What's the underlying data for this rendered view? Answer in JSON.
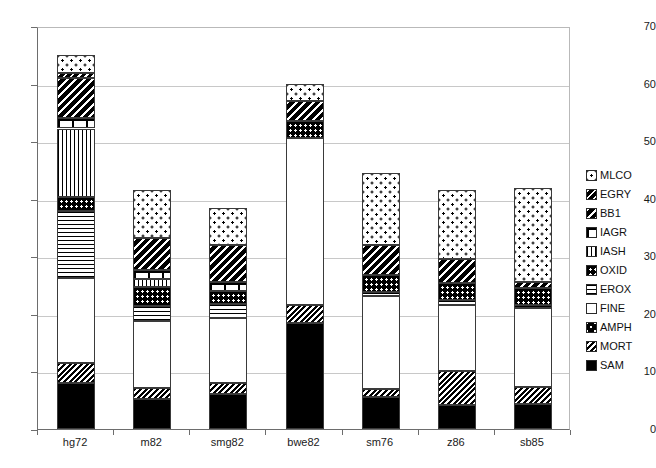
{
  "chart_data": {
    "type": "bar",
    "subtype": "stacked-bar",
    "title": "",
    "xlabel": "",
    "ylabel": "",
    "ylim": [
      0,
      70
    ],
    "yticks": [
      0,
      10,
      20,
      30,
      40,
      50,
      60,
      70
    ],
    "grid": true,
    "legend_position": "right",
    "categories": [
      "hg72",
      "m82",
      "smg82",
      "bwe82",
      "sm76",
      "z86",
      "sb85"
    ],
    "totals": [
      65.0,
      41.6,
      38.4,
      60.0,
      44.5,
      41.6,
      41.8
    ],
    "stack_order_bottom_to_top": [
      "SAM",
      "MORT",
      "AMPH",
      "FINE",
      "EROX",
      "OXID",
      "IASH",
      "IAGR",
      "BB1",
      "EGRY",
      "MLCO"
    ],
    "series": [
      {
        "name": "SAM",
        "values": [
          8.0,
          5.2,
          6.0,
          18.5,
          5.6,
          4.2,
          4.3
        ]
      },
      {
        "name": "MORT",
        "values": [
          3.5,
          2.0,
          2.0,
          3.0,
          1.3,
          5.9,
          3.0
        ]
      },
      {
        "name": "AMPH",
        "values": [
          0.0,
          0.0,
          0.0,
          0.0,
          0.0,
          0.0,
          0.0
        ]
      },
      {
        "name": "FINE",
        "values": [
          14.8,
          11.6,
          11.2,
          29.0,
          16.2,
          11.5,
          13.7
        ]
      },
      {
        "name": "EROX",
        "values": [
          11.5,
          2.6,
          2.5,
          0.0,
          0.7,
          0.8,
          0.5
        ]
      },
      {
        "name": "OXID",
        "values": [
          2.5,
          3.3,
          2.3,
          3.0,
          3.0,
          3.0,
          3.0
        ]
      },
      {
        "name": "IASH",
        "values": [
          11.9,
          1.4,
          0.0,
          0.0,
          0.0,
          0.0,
          0.0
        ]
      },
      {
        "name": "IAGR",
        "values": [
          1.8,
          1.5,
          1.5,
          0.0,
          0.0,
          0.0,
          0.0
        ]
      },
      {
        "name": "BB1",
        "values": [
          7.0,
          5.5,
          6.5,
          3.5,
          5.2,
          4.2,
          1.1
        ]
      },
      {
        "name": "EGRY",
        "values": [
          0.8,
          0.0,
          0.0,
          0.0,
          0.0,
          0.0,
          0.0
        ]
      },
      {
        "name": "MLCO",
        "values": [
          3.2,
          8.5,
          6.4,
          3.0,
          12.5,
          12.0,
          16.2
        ]
      }
    ]
  },
  "legend": {
    "items": [
      {
        "label": "MLCO",
        "pattern": "MLCO"
      },
      {
        "label": "EGRY",
        "pattern": "EGRY"
      },
      {
        "label": "BB1",
        "pattern": "BB1"
      },
      {
        "label": "IAGR",
        "pattern": "IAGR"
      },
      {
        "label": "IASH",
        "pattern": "IASH"
      },
      {
        "label": "OXID",
        "pattern": "OXID"
      },
      {
        "label": "EROX",
        "pattern": "EROX"
      },
      {
        "label": "FINE",
        "pattern": "FINE"
      },
      {
        "label": "AMPH",
        "pattern": "AMPH"
      },
      {
        "label": "MORT",
        "pattern": "MORT"
      },
      {
        "label": "SAM",
        "pattern": "SAM"
      }
    ]
  },
  "axes": {
    "y_tick_labels": [
      "70",
      "60",
      "50",
      "40",
      "30",
      "20",
      "10",
      "0"
    ],
    "x_tick_labels": [
      "hg72",
      "m82",
      "smg82",
      "bwe82",
      "sm76",
      "z86",
      "sb85"
    ]
  }
}
